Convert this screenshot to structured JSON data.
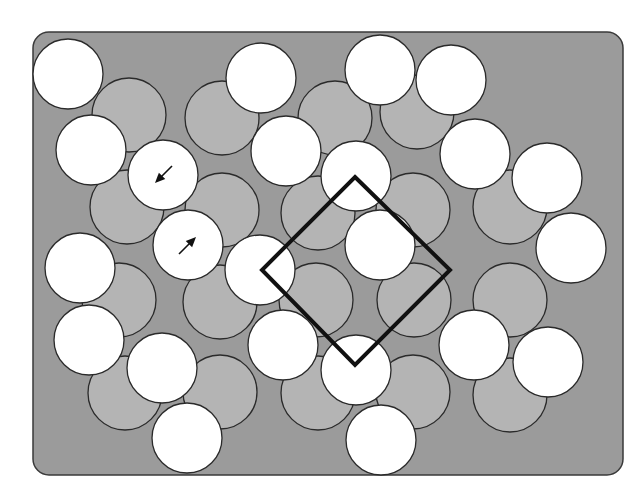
{
  "figure": {
    "panel": {
      "x": 33,
      "y": 32,
      "width": 590,
      "height": 443,
      "radius": 16
    },
    "colors": {
      "background": "#ffffff",
      "panel_fill": "#9b9b9b",
      "panel_stroke": "#3a3a3a",
      "gray_circle_fill": "#b4b4b4",
      "white_circle_fill": "#ffffff",
      "circle_stroke": "#2a2a2a",
      "diamond_stroke": "#111111",
      "arrow": "#111111"
    },
    "gray_circle_radius": 37,
    "white_circle_radius": 35,
    "gray_circles": [
      [
        129,
        115
      ],
      [
        222,
        118
      ],
      [
        335,
        118
      ],
      [
        417,
        112
      ],
      [
        127,
        207
      ],
      [
        222,
        210
      ],
      [
        318,
        213
      ],
      [
        413,
        210
      ],
      [
        510,
        207
      ],
      [
        119,
        300
      ],
      [
        220,
        302
      ],
      [
        316,
        300
      ],
      [
        414,
        300
      ],
      [
        510,
        300
      ],
      [
        125,
        393
      ],
      [
        220,
        392
      ],
      [
        318,
        393
      ],
      [
        413,
        392
      ],
      [
        510,
        395
      ]
    ],
    "white_circles": [
      [
        68,
        74
      ],
      [
        91,
        150
      ],
      [
        80,
        268
      ],
      [
        89,
        340
      ],
      [
        162,
        368
      ],
      [
        187,
        438
      ],
      [
        261,
        78
      ],
      [
        286,
        151
      ],
      [
        356,
        176
      ],
      [
        260,
        270
      ],
      [
        283,
        345
      ],
      [
        380,
        245
      ],
      [
        356,
        370
      ],
      [
        381,
        440
      ],
      [
        380,
        70
      ],
      [
        451,
        80
      ],
      [
        475,
        154
      ],
      [
        547,
        178
      ],
      [
        571,
        248
      ],
      [
        474,
        345
      ],
      [
        548,
        362
      ]
    ],
    "arrow_circles": [
      {
        "cx": 163,
        "cy": 175,
        "direction": "down-left"
      },
      {
        "cx": 188,
        "cy": 245,
        "direction": "up-right"
      }
    ],
    "diamond": {
      "points": [
        [
          355,
          177
        ],
        [
          450,
          270
        ],
        [
          355,
          365
        ],
        [
          262,
          270
        ]
      ],
      "stroke_width": 4
    }
  }
}
